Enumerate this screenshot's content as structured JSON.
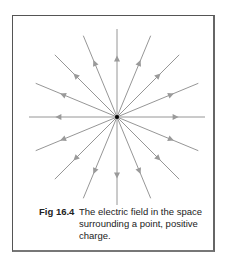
{
  "figure": {
    "label": "Fig 16.4",
    "caption": "The electric field in the space surrounding a point, positive charge.",
    "diagram": {
      "type": "radial-field-lines",
      "center": [
        117,
        117
      ],
      "ray_count": 16,
      "angle_step_deg": 22.5,
      "ray_length": 88,
      "arrow_direction": "outward",
      "line_color": "#8a8a8a",
      "arrow_color": "#9a9a9a",
      "charge_color": "#000000",
      "charge_sign": "positive"
    }
  }
}
